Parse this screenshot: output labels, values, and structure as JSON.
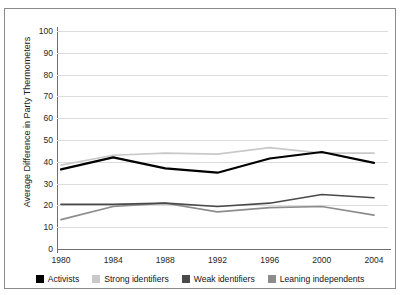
{
  "chart_data": {
    "type": "line",
    "title": "",
    "xlabel": "",
    "ylabel": "Average Difference in Party Thermometers",
    "x": [
      1980,
      1984,
      1988,
      1992,
      1996,
      2000,
      2004
    ],
    "categories": [
      "1980",
      "1984",
      "1988",
      "1992",
      "1996",
      "2000",
      "2004"
    ],
    "ylim": [
      0,
      100
    ],
    "yticks": [
      0,
      10,
      20,
      30,
      40,
      50,
      60,
      70,
      80,
      90,
      100
    ],
    "ytick_labels": [
      "0",
      "10",
      "20",
      "30",
      "40",
      "50",
      "60",
      "70",
      "80",
      "90",
      "100"
    ],
    "grid": true,
    "legend_position": "bottom",
    "series": [
      {
        "name": "Activists",
        "color": "#000000",
        "values": [
          36.5,
          42.0,
          37.0,
          35.0,
          41.5,
          44.5,
          39.5
        ]
      },
      {
        "name": "Strong identifiers",
        "color": "#c9c9c9",
        "values": [
          38.5,
          43.0,
          44.0,
          43.5,
          46.5,
          44.0,
          44.0
        ]
      },
      {
        "name": "Weak identifiers",
        "color": "#4a4a4a",
        "values": [
          20.5,
          20.5,
          21.0,
          19.5,
          21.0,
          25.0,
          23.5
        ]
      },
      {
        "name": "Leaning independents",
        "color": "#8c8c8c",
        "values": [
          13.5,
          19.5,
          21.0,
          17.0,
          19.0,
          19.5,
          15.5
        ]
      }
    ]
  },
  "legend": {
    "items": [
      {
        "label": "Activists",
        "color": "#000000"
      },
      {
        "label": "Strong identifiers",
        "color": "#c9c9c9"
      },
      {
        "label": "Weak identifiers",
        "color": "#4a4a4a"
      },
      {
        "label": "Leaning independents",
        "color": "#8c8c8c"
      }
    ]
  },
  "colors": {
    "frame": "#8a8a8a",
    "axis": "#6f6f6f",
    "grid": "#dcdcdc",
    "background": "#ffffff",
    "text": "#1a1a1a"
  }
}
